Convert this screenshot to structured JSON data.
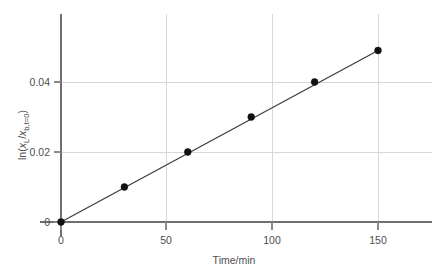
{
  "chart_data": {
    "type": "scatter",
    "title": "",
    "xlabel": "Time/min",
    "ylabel": "ln(xL/xb,t=0)",
    "ylabel_parts": {
      "prefix": "ln(",
      "num_var": "x",
      "num_sub": "L",
      "slash": "/",
      "den_var": "x",
      "den_sub": "b,t=0",
      "suffix": ")"
    },
    "x": [
      0,
      30,
      60,
      90,
      120,
      150
    ],
    "values": [
      0,
      0.01,
      0.02,
      0.03,
      0.04,
      0.049
    ],
    "series": [
      {
        "name": "ln(xL/xb,t=0) vs time",
        "points": [
          {
            "x": 0,
            "y": 0
          },
          {
            "x": 30,
            "y": 0.01
          },
          {
            "x": 60,
            "y": 0.02
          },
          {
            "x": 90,
            "y": 0.03
          },
          {
            "x": 120,
            "y": 0.04
          },
          {
            "x": 150,
            "y": 0.049
          }
        ]
      }
    ],
    "fit_line": {
      "type": "linear",
      "through_origin": true,
      "x_start": 0,
      "y_start": 0,
      "x_end": 150,
      "y_end": 0.049
    },
    "xlim": [
      0,
      168
    ],
    "ylim": [
      -0.0035,
      0.0565
    ],
    "xticks": [
      0,
      50,
      100,
      150
    ],
    "xtick_labels": [
      "0",
      "50",
      "100",
      "150"
    ],
    "yticks": [
      0,
      0.02,
      0.04
    ],
    "ytick_labels": [
      "0",
      "0.02",
      "0.04"
    ],
    "grid": true,
    "grid_axis": "both",
    "legend": "none",
    "marker": "filled-circle",
    "colors": {
      "marker": "#111111",
      "line": "#3a3a3a",
      "grid": "#d8d8d8",
      "axis": "#6f6f6f",
      "text": "#4d4d4d",
      "background": "#ffffff"
    }
  }
}
